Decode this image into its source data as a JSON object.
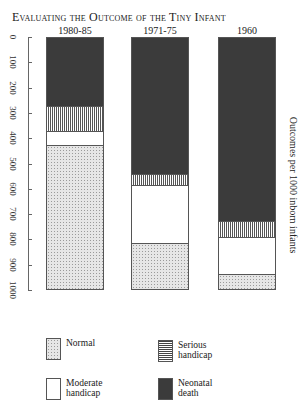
{
  "chart_data": {
    "type": "bar",
    "stacked": true,
    "orientation": "vertical",
    "y_axis_inverted": true,
    "title": "Evaluating the Outcome of the Tiny Infant",
    "xlabel": "",
    "ylabel": "Outcomes per 1000 inborn infants",
    "ylim": [
      0,
      1000
    ],
    "yticks": [
      "0",
      "100",
      "200",
      "300",
      "400",
      "500",
      "600",
      "700",
      "800",
      "900",
      "1000"
    ],
    "categories": [
      "1980-85",
      "1971-75",
      "1960"
    ],
    "stack_order_top_to_bottom": [
      "Neonatal death",
      "Serious handicap",
      "Moderate handicap",
      "Normal"
    ],
    "series": [
      {
        "name": "Neonatal death",
        "values": [
          270,
          540,
          731
        ],
        "color": "#3b3b3b",
        "pattern": "solid dark"
      },
      {
        "name": "Serious handicap",
        "values": [
          100,
          45,
          63
        ],
        "color": "#777777",
        "pattern": "lines"
      },
      {
        "name": "Moderate handicap",
        "values": [
          57,
          233,
          147
        ],
        "color": "#ffffff",
        "pattern": "blank"
      },
      {
        "name": "Normal",
        "values": [
          573,
          182,
          59
        ],
        "color": "#e6e6e6",
        "pattern": "stipple"
      }
    ],
    "legend_position": "bottom",
    "grid": false
  },
  "title": "Evaluating the Outcome of the Tiny Infant",
  "columns": [
    "1980-85",
    "1971-75",
    "1960"
  ],
  "yticks": [
    "0",
    "100",
    "200",
    "300",
    "400",
    "500",
    "600",
    "700",
    "800",
    "900",
    "1000"
  ],
  "ylabel": "Outcomes per 1000 inborn infants",
  "legend": {
    "normal": "Normal",
    "serious": "Serious handicap",
    "moderate": "Moderate handicap",
    "death": "Neonatal death"
  }
}
